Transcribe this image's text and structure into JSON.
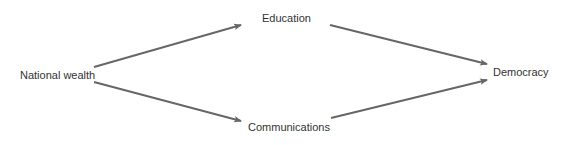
{
  "diagram": {
    "type": "causal-path-diagram",
    "nodes": [
      {
        "id": "national_wealth",
        "label": "National wealth",
        "x": 20,
        "y": 69
      },
      {
        "id": "education",
        "label": "Education",
        "x": 262,
        "y": 12
      },
      {
        "id": "communications",
        "label": "Communications",
        "x": 248,
        "y": 121
      },
      {
        "id": "democracy",
        "label": "Democracy",
        "x": 493,
        "y": 66
      }
    ],
    "edges": [
      {
        "from": "national_wealth",
        "to": "education",
        "x1": 94,
        "y1": 67,
        "x2": 241,
        "y2": 25
      },
      {
        "from": "national_wealth",
        "to": "communications",
        "x1": 94,
        "y1": 82,
        "x2": 241,
        "y2": 121
      },
      {
        "from": "education",
        "to": "democracy",
        "x1": 330,
        "y1": 25,
        "x2": 487,
        "y2": 64
      },
      {
        "from": "communications",
        "to": "democracy",
        "x1": 331,
        "y1": 118,
        "x2": 487,
        "y2": 80
      }
    ],
    "colors": {
      "edge": "#666666",
      "text": "#333333",
      "background": "#ffffff"
    }
  }
}
